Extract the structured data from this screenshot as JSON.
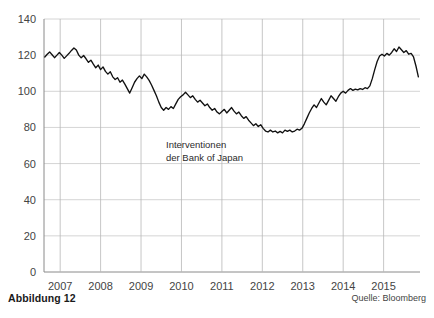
{
  "figure": {
    "caption": "Abbildung 12",
    "source": "Quelle: Bloomberg"
  },
  "annotation": {
    "line1": "Interventionen",
    "line2": "der Bank of Japan"
  },
  "chart_data": {
    "type": "line",
    "title": "",
    "xlabel": "",
    "ylabel": "",
    "grid": true,
    "legend": "none",
    "xlim": [
      2006.6,
      2015.9
    ],
    "ylim": [
      0,
      140
    ],
    "yticks": [
      0,
      20,
      40,
      60,
      80,
      100,
      120,
      140
    ],
    "ytick_labels": [
      "0",
      "20",
      "40",
      "60",
      "80",
      "100",
      "120",
      "140"
    ],
    "xticks": [
      2007,
      2008,
      2009,
      2010,
      2011,
      2012,
      2013,
      2014,
      2015
    ],
    "xtick_labels": [
      "2007",
      "2008",
      "2009",
      "2010",
      "2011",
      "2012",
      "2013",
      "2014",
      "2015"
    ],
    "series": [
      {
        "name": "JPY",
        "color": "#111111",
        "x": [
          2006.62,
          2006.68,
          2006.74,
          2006.8,
          2006.86,
          2006.92,
          2006.98,
          2007.04,
          2007.1,
          2007.16,
          2007.22,
          2007.28,
          2007.34,
          2007.4,
          2007.46,
          2007.52,
          2007.58,
          2007.64,
          2007.7,
          2007.76,
          2007.82,
          2007.88,
          2007.94,
          2008.0,
          2008.06,
          2008.12,
          2008.18,
          2008.24,
          2008.3,
          2008.36,
          2008.42,
          2008.48,
          2008.54,
          2008.6,
          2008.66,
          2008.72,
          2008.78,
          2008.84,
          2008.9,
          2008.96,
          2009.02,
          2009.08,
          2009.14,
          2009.2,
          2009.26,
          2009.32,
          2009.38,
          2009.44,
          2009.5,
          2009.56,
          2009.62,
          2009.68,
          2009.74,
          2009.8,
          2009.86,
          2009.92,
          2009.98,
          2010.04,
          2010.1,
          2010.16,
          2010.22,
          2010.28,
          2010.34,
          2010.4,
          2010.46,
          2010.52,
          2010.58,
          2010.64,
          2010.7,
          2010.76,
          2010.82,
          2010.88,
          2010.94,
          2011.0,
          2011.06,
          2011.12,
          2011.18,
          2011.24,
          2011.3,
          2011.36,
          2011.42,
          2011.48,
          2011.54,
          2011.6,
          2011.66,
          2011.72,
          2011.78,
          2011.84,
          2011.9,
          2011.96,
          2012.02,
          2012.08,
          2012.14,
          2012.2,
          2012.26,
          2012.32,
          2012.38,
          2012.44,
          2012.5,
          2012.56,
          2012.62,
          2012.68,
          2012.74,
          2012.8,
          2012.86,
          2012.92,
          2012.98,
          2013.04,
          2013.1,
          2013.16,
          2013.22,
          2013.28,
          2013.34,
          2013.4,
          2013.46,
          2013.52,
          2013.58,
          2013.64,
          2013.7,
          2013.76,
          2013.82,
          2013.88,
          2013.94,
          2014.0,
          2014.06,
          2014.12,
          2014.18,
          2014.24,
          2014.3,
          2014.36,
          2014.42,
          2014.48,
          2014.54,
          2014.6,
          2014.66,
          2014.72,
          2014.78,
          2014.84,
          2014.9,
          2014.96,
          2015.02,
          2015.08,
          2015.14,
          2015.2,
          2015.26,
          2015.32,
          2015.38,
          2015.44,
          2015.5,
          2015.56,
          2015.62,
          2015.68,
          2015.74,
          2015.8,
          2015.86
        ],
        "y": [
          119.0,
          120.5,
          121.8,
          120.2,
          118.6,
          120.0,
          121.5,
          120.0,
          118.2,
          119.6,
          121.0,
          122.6,
          124.0,
          122.8,
          120.0,
          118.5,
          119.8,
          118.0,
          116.0,
          117.2,
          115.0,
          113.0,
          114.5,
          112.0,
          113.5,
          111.0,
          109.5,
          110.8,
          108.0,
          106.5,
          107.5,
          105.0,
          106.2,
          104.0,
          101.5,
          99.0,
          102.0,
          105.0,
          107.0,
          108.5,
          107.0,
          109.5,
          108.0,
          106.0,
          103.5,
          100.5,
          97.5,
          94.0,
          91.0,
          89.5,
          91.0,
          90.0,
          91.5,
          90.5,
          93.0,
          95.5,
          97.0,
          98.0,
          99.5,
          98.0,
          96.5,
          97.5,
          95.5,
          94.0,
          95.0,
          93.5,
          92.0,
          93.0,
          91.0,
          89.5,
          90.5,
          88.5,
          87.5,
          88.8,
          90.0,
          88.0,
          89.5,
          91.0,
          89.0,
          87.5,
          88.5,
          86.5,
          85.0,
          86.0,
          84.0,
          82.5,
          81.0,
          82.0,
          80.5,
          81.5,
          79.5,
          78.0,
          77.5,
          78.5,
          77.5,
          78.0,
          77.0,
          77.8,
          77.0,
          78.5,
          77.8,
          78.5,
          77.5,
          78.0,
          79.0,
          78.5,
          79.5,
          82.0,
          85.0,
          88.0,
          90.5,
          92.5,
          91.0,
          93.5,
          96.0,
          94.0,
          92.5,
          95.0,
          97.5,
          96.0,
          94.5,
          97.0,
          99.0,
          100.0,
          99.0,
          100.5,
          101.5,
          100.5,
          101.2,
          100.8,
          101.5,
          101.0,
          102.0,
          101.5,
          103.0,
          107.0,
          112.0,
          116.5,
          119.5,
          120.5,
          119.5,
          121.0,
          120.0,
          121.5,
          123.5,
          122.0,
          124.5,
          123.0,
          121.5,
          122.5,
          120.5,
          121.0,
          119.0,
          114.0,
          108.0
        ]
      }
    ]
  }
}
